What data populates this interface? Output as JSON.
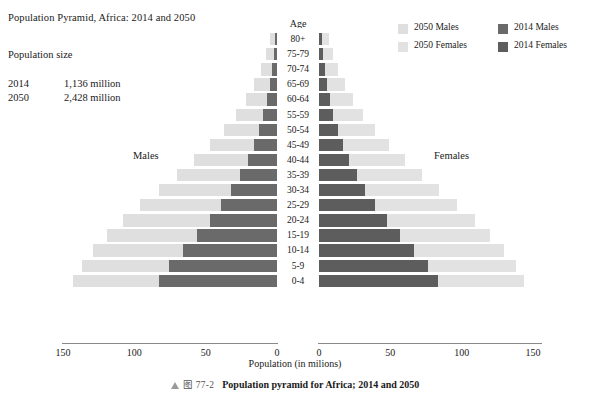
{
  "header": {
    "title": "Population Pyramid, Africa: 2014 and 2050",
    "popsize_label": "Population size",
    "population_rows": [
      {
        "year": "2014",
        "value": "1,136 million"
      },
      {
        "year": "2050",
        "value": "2,428 million"
      }
    ]
  },
  "legend": {
    "items": [
      {
        "label": "2050 Males",
        "color": "#dfdfdf"
      },
      {
        "label": "2050 Females",
        "color": "#e2e2e2"
      },
      {
        "label": "2014 Males",
        "color": "#6a6a6a"
      },
      {
        "label": "2014 Females",
        "color": "#5d5d5d"
      }
    ]
  },
  "axes": {
    "age_header": "Age",
    "males_label": "Males",
    "females_label": "Females",
    "xlabel": "Population (in milions)",
    "left_ticks": [
      "150",
      "100",
      "50",
      "0"
    ],
    "right_ticks": [
      "0",
      "50",
      "100",
      "150"
    ]
  },
  "caption": {
    "figure_number": "图 77-2",
    "text": "Population pyramid for Africa; 2014 and 2050"
  },
  "chart_data": {
    "type": "bar",
    "title": "Population Pyramid, Africa: 2014 and 2050",
    "subtype": "population-pyramid",
    "xlabel": "Population (in milions)",
    "ylabel": "Age",
    "xlim": [
      0,
      150
    ],
    "xticks": [
      0,
      50,
      100,
      150
    ],
    "grid": false,
    "legend_position": "top-right",
    "units": "millions",
    "categories": [
      "80+",
      "75-79",
      "70-74",
      "65-69",
      "60-64",
      "55-59",
      "50-54",
      "45-49",
      "40-44",
      "35-39",
      "30-34",
      "25-29",
      "20-24",
      "15-19",
      "10-14",
      "5-9",
      "0-4"
    ],
    "series": [
      {
        "name": "2014 Males",
        "side": "left",
        "color": "#6a6a6a",
        "values": [
          1.5,
          2.3,
          3.5,
          5.0,
          7.0,
          9.5,
          12.5,
          16.0,
          20.5,
          26.0,
          32.0,
          39.0,
          47.0,
          56.0,
          66.0,
          76.0,
          83.0
        ]
      },
      {
        "name": "2050 Males",
        "side": "left",
        "color": "#dfdfdf",
        "values": [
          5.0,
          7.5,
          11.0,
          16.0,
          22.0,
          29.0,
          37.0,
          47.0,
          58.0,
          70.0,
          83.0,
          96.0,
          108.0,
          119.0,
          129.0,
          137.0,
          143.0
        ]
      },
      {
        "name": "2014 Females",
        "side": "right",
        "color": "#5d5d5d",
        "values": [
          2.0,
          2.8,
          4.0,
          5.5,
          7.5,
          10.0,
          13.0,
          16.5,
          21.0,
          26.5,
          32.5,
          39.5,
          47.5,
          56.5,
          66.5,
          76.5,
          83.5
        ]
      },
      {
        "name": "2050 Females",
        "side": "right",
        "color": "#e2e2e2",
        "values": [
          7.0,
          9.5,
          13.0,
          18.0,
          24.0,
          31.0,
          39.0,
          49.0,
          60.0,
          72.0,
          84.0,
          97.0,
          109.0,
          120.0,
          130.0,
          138.0,
          144.0
        ]
      }
    ],
    "annotations": [
      {
        "text": "Population size"
      },
      {
        "text": "2014  1,136 million"
      },
      {
        "text": "2050  2,428 million"
      },
      {
        "text": "Males",
        "side": "left"
      },
      {
        "text": "Females",
        "side": "right"
      }
    ]
  }
}
